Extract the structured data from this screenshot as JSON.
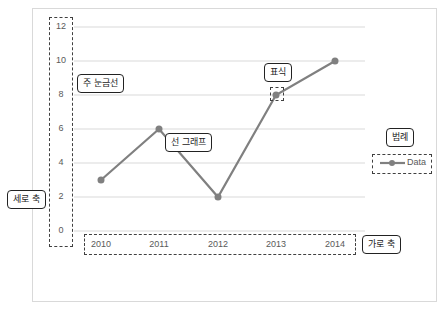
{
  "chart_data": {
    "type": "line",
    "categories": [
      "2010",
      "2011",
      "2012",
      "2013",
      "2014"
    ],
    "series": [
      {
        "name": "Data",
        "values": [
          3,
          6,
          2,
          8,
          10
        ],
        "color": "#808080"
      }
    ],
    "title": "",
    "xlabel": "",
    "ylabel": "",
    "ylim": [
      0,
      12
    ],
    "yticks": [
      "0",
      "2",
      "4",
      "6",
      "8",
      "10",
      "12"
    ],
    "grid": true,
    "legend_position": "right"
  },
  "annotations": {
    "major_gridline": "주 눈금선",
    "line_graph": "선 그래프",
    "marker": "표식",
    "legend": "범례",
    "vertical_axis": "세로 축",
    "horizontal_axis": "가로 축"
  },
  "legend": {
    "label": "Data"
  }
}
